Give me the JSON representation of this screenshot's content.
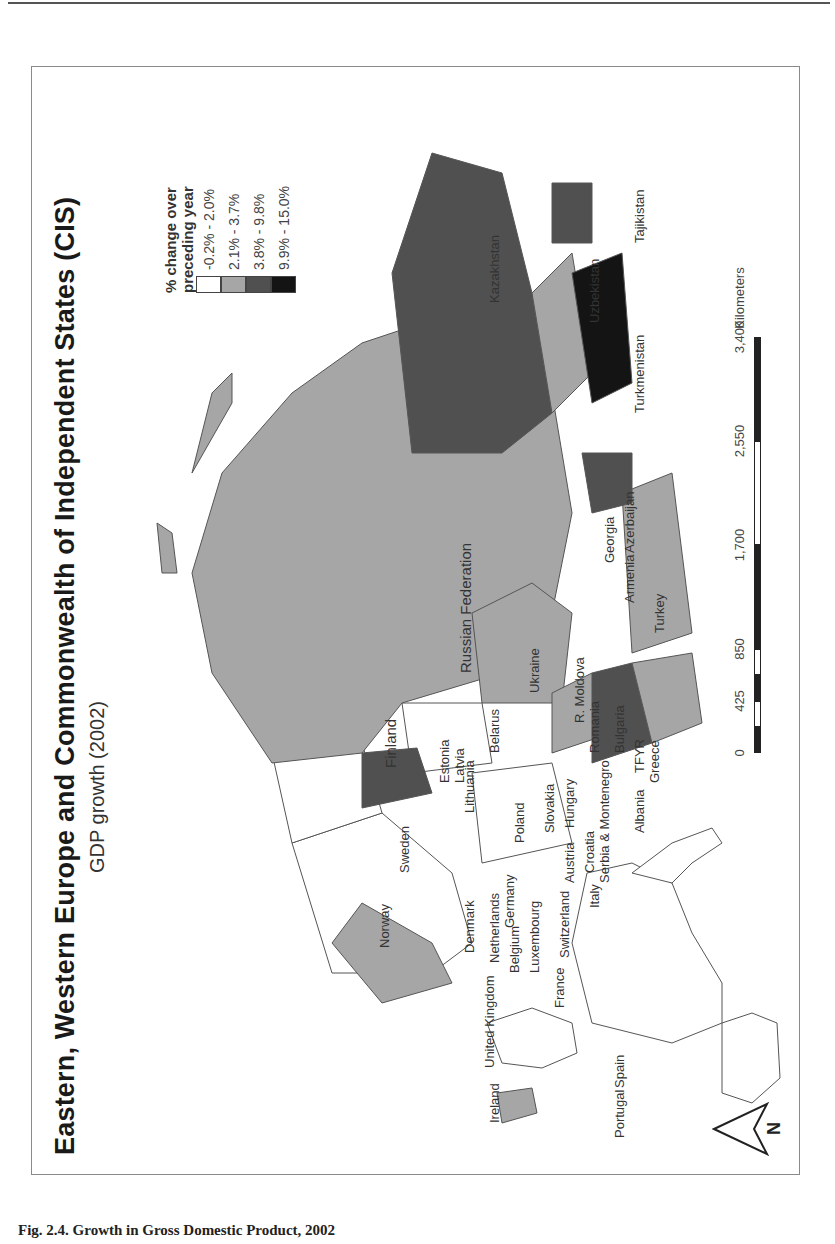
{
  "page": {
    "caption": "Fig. 2.4. Growth in Gross Domestic Product, 2002"
  },
  "map": {
    "title": "Eastern, Western Europe and Commonwealth of Independent States (CIS)",
    "subtitle": "GDP growth (2002)",
    "orientation": "rotated 90° counter-clockwise on page",
    "legend": {
      "title_line1": "% change over",
      "title_line2": "preceding year",
      "classes": [
        {
          "label": "-0.2% - 2.0%",
          "color": "#ffffff"
        },
        {
          "label": "2.1% - 3.7%",
          "color": "#a6a6a6"
        },
        {
          "label": "3.8% - 9.8%",
          "color": "#505050"
        },
        {
          "label": "9.9% - 15.0%",
          "color": "#141414"
        }
      ]
    },
    "scale_bar": {
      "unit": "Kilometers",
      "ticks": [
        "0",
        "425",
        "850",
        "1,700",
        "2,550",
        "3,400"
      ]
    },
    "north_arrow": {
      "label": "N"
    },
    "countries": [
      {
        "name": "Russian Federation",
        "class": 1
      },
      {
        "name": "Kazakhstan",
        "class": 2
      },
      {
        "name": "Uzbekistan",
        "class": 1
      },
      {
        "name": "Turkmenistan",
        "class": 3
      },
      {
        "name": "Tajikistan",
        "class": 2
      },
      {
        "name": "Georgia",
        "class": 1
      },
      {
        "name": "Armenia",
        "class": 2
      },
      {
        "name": "Azerbaijan",
        "class": 2
      },
      {
        "name": "Turkey",
        "class": 1
      },
      {
        "name": "Ukraine",
        "class": 1
      },
      {
        "name": "R. Moldova",
        "class": 1
      },
      {
        "name": "Romania",
        "class": 1
      },
      {
        "name": "Bulgaria",
        "class": 2
      },
      {
        "name": "Belarus",
        "class": 0
      },
      {
        "name": "Estonia",
        "class": 2
      },
      {
        "name": "Latvia",
        "class": 2
      },
      {
        "name": "Lithuania",
        "class": 1
      },
      {
        "name": "Poland",
        "class": 0
      },
      {
        "name": "Slovakia",
        "class": 1
      },
      {
        "name": "Hungary",
        "class": 1
      },
      {
        "name": "Austria",
        "class": 0
      },
      {
        "name": "Croatia",
        "class": 2
      },
      {
        "name": "Serbia & Montenegro",
        "class": 2
      },
      {
        "name": "TFYR Macedonia",
        "class": 0
      },
      {
        "name": "Albania",
        "class": 0
      },
      {
        "name": "Greece",
        "class": 1
      },
      {
        "name": "Finland",
        "class": 0
      },
      {
        "name": "Sweden",
        "class": 0
      },
      {
        "name": "Norway",
        "class": 1
      },
      {
        "name": "Denmark",
        "class": 0
      },
      {
        "name": "Netherlands",
        "class": 0
      },
      {
        "name": "Germany",
        "class": 0
      },
      {
        "name": "Belgium",
        "class": 0
      },
      {
        "name": "Luxembourg",
        "class": 0
      },
      {
        "name": "France",
        "class": 0
      },
      {
        "name": "Switzerland",
        "class": 0
      },
      {
        "name": "Italy",
        "class": 0
      },
      {
        "name": "United Kingdom",
        "class": 0
      },
      {
        "name": "Ireland",
        "class": 1
      },
      {
        "name": "Spain",
        "class": 0
      },
      {
        "name": "Portugal",
        "class": 0
      }
    ],
    "labels": {
      "russia": "Russian Federation",
      "kazakhstan": "Kazakhstan",
      "uzbekistan": "Uzbekistan",
      "turkmenistan": "Turkmenistan",
      "tajikistan": "Tajikistan",
      "georgia": "Georgia",
      "armenia": "Armenia",
      "azerbaijan": "Azerbaijan",
      "turkey": "Turkey",
      "ukraine": "Ukraine",
      "moldova": "R. Moldova",
      "romania": "Romania",
      "bulgaria": "Bulgaria",
      "belarus": "Belarus",
      "estonia": "Estonia",
      "latvia": "Latvia",
      "lithuania": "Lithuania",
      "poland": "Poland",
      "slovakia": "Slovakia",
      "hungary": "Hungary",
      "austria": "Austria",
      "croatia": "Croatia",
      "serbia": "Serbia & Montenegro",
      "macedonia": "TFYR",
      "albania": "Albania",
      "greece": "Greece",
      "finland": "Finland",
      "sweden": "Sweden",
      "norway": "Norway",
      "denmark": "Denmark",
      "netherlands": "Netherlands",
      "germany": "Germany",
      "belgium": "Belgium",
      "luxembourg": "Luxembourg",
      "france": "France",
      "switzerland": "Switzerland",
      "italy": "Italy",
      "uk": "United Kingdom",
      "ireland": "Ireland",
      "spain": "Spain",
      "portugal": "Portugal"
    }
  }
}
